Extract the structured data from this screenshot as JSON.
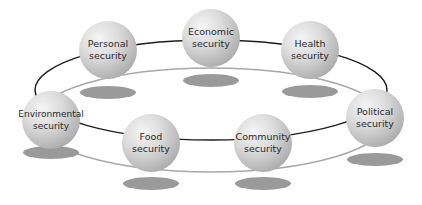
{
  "diagram": {
    "nodes": [
      {
        "id": "personal",
        "label": "Personal\nsecurity",
        "cx": 108,
        "cy": 50
      },
      {
        "id": "economic",
        "label": "Economic\nsecurity",
        "cx": 211,
        "cy": 38
      },
      {
        "id": "health",
        "label": "Health\nsecurity",
        "cx": 310,
        "cy": 50
      },
      {
        "id": "political",
        "label": "Political\nsecurity",
        "cx": 375,
        "cy": 118
      },
      {
        "id": "community",
        "label": "Community\nsecurity",
        "cx": 263,
        "cy": 143
      },
      {
        "id": "food",
        "label": "Food\nsecurity",
        "cx": 151,
        "cy": 143
      },
      {
        "id": "environmental",
        "label": "Environmental\nsecurity",
        "cx": 51,
        "cy": 120
      }
    ],
    "colors": {
      "ring_dark": "#1e1e1e",
      "ring_light": "#a8a8a8",
      "shadow": "#9a9a9a"
    }
  }
}
